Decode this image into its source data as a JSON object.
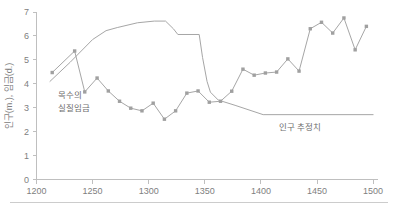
{
  "figure": {
    "background_color": "#ffffff",
    "line_color": "#a6a6a6",
    "marker_color": "#a0a0a0",
    "axis_color": "#bfbfbf",
    "text_color": "#808080"
  },
  "axis": {
    "y_title": "인구(m.), 임금(d.)",
    "y_ticks": [
      "0",
      "1",
      "2",
      "3",
      "4",
      "5",
      "6",
      "7"
    ],
    "x_ticks": [
      "1200",
      "1250",
      "1300",
      "1350",
      "1400",
      "1450",
      "1500"
    ]
  },
  "annotations": {
    "wage_label_line1": "목수의",
    "wage_label_line2": "실질임금",
    "population_label": "인구 추정치"
  },
  "footer": {
    "rule_color": "#cccccc"
  },
  "chart_data": {
    "type": "line",
    "title": "",
    "subtitle": "",
    "xlabel": "",
    "ylabel": "인구(m.), 임금(d.)",
    "xlim": [
      1200,
      1505
    ],
    "ylim": [
      0,
      7
    ],
    "grid": false,
    "legend": "none (inline annotations)",
    "xticks": [
      1200,
      1250,
      1300,
      1350,
      1400,
      1450,
      1500
    ],
    "yticks": [
      0,
      1,
      2,
      3,
      4,
      5,
      6,
      7
    ],
    "series": [
      {
        "name": "목수의 실질임금",
        "label": "목수의 실질임금",
        "markers": true,
        "x": [
          1214,
          1234,
          1243,
          1254,
          1264,
          1274,
          1284,
          1294,
          1304,
          1314,
          1324,
          1334,
          1344,
          1354,
          1364,
          1374,
          1384,
          1394,
          1404,
          1414,
          1424,
          1434,
          1444,
          1454,
          1464,
          1474,
          1484,
          1494
        ],
        "y": [
          4.47,
          5.37,
          3.66,
          4.24,
          3.7,
          3.27,
          2.98,
          2.87,
          3.19,
          2.52,
          2.87,
          3.61,
          3.7,
          3.23,
          3.27,
          3.69,
          4.61,
          4.36,
          4.45,
          4.49,
          5.04,
          4.53,
          6.3,
          6.57,
          6.12,
          6.75,
          5.42,
          6.4
        ]
      },
      {
        "name": "인구 추정치",
        "label": "인구 추정치",
        "markers": false,
        "x": [
          1212,
          1230,
          1250,
          1262,
          1272,
          1290,
          1305,
          1315,
          1322,
          1326,
          1345,
          1348,
          1352,
          1355,
          1362,
          1377,
          1402,
          1500
        ],
        "y": [
          4.1,
          4.9,
          5.85,
          6.22,
          6.35,
          6.55,
          6.62,
          6.62,
          6.3,
          6.06,
          6.06,
          5.1,
          4.1,
          3.65,
          3.32,
          3.1,
          2.71,
          2.71
        ]
      }
    ]
  }
}
